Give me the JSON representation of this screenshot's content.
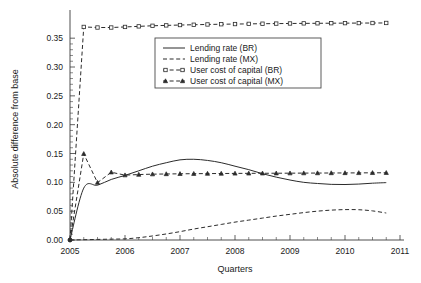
{
  "chart_data": {
    "type": "line",
    "title": "",
    "xlabel": "Quarters",
    "ylabel": "Absolute difference from base",
    "xlim": [
      2005.0,
      2011.0
    ],
    "ylim": [
      0.0,
      0.385
    ],
    "grid": false,
    "legend_position": "top-center",
    "xticks": [
      "2005",
      "2006",
      "2007",
      "2008",
      "2009",
      "2010",
      "2011"
    ],
    "xtick_values": [
      2005,
      2006,
      2007,
      2008,
      2009,
      2010,
      2011
    ],
    "yticks": [
      "0.00",
      "0.05",
      "0.10",
      "0.15",
      "0.20",
      "0.25",
      "0.30",
      "0.35"
    ],
    "ytick_values": [
      0.0,
      0.05,
      0.1,
      0.15,
      0.2,
      0.25,
      0.3,
      0.35
    ],
    "x": [
      2005.0,
      2005.25,
      2005.5,
      2005.75,
      2006.0,
      2006.25,
      2006.5,
      2006.75,
      2007.0,
      2007.25,
      2007.5,
      2007.75,
      2008.0,
      2008.25,
      2008.5,
      2008.75,
      2009.0,
      2009.25,
      2009.5,
      2009.75,
      2010.0,
      2010.25,
      2010.5,
      2010.75
    ],
    "series": [
      {
        "name": "Lending rate (BR)",
        "style": "solid",
        "marker": "none",
        "values": [
          0.0,
          0.09,
          0.095,
          0.105,
          0.112,
          0.12,
          0.128,
          0.134,
          0.139,
          0.14,
          0.138,
          0.134,
          0.128,
          0.122,
          0.115,
          0.109,
          0.104,
          0.1,
          0.098,
          0.0965,
          0.0962,
          0.097,
          0.0985,
          0.0995
        ]
      },
      {
        "name": "Lending rate (MX)",
        "style": "dashed",
        "marker": "none",
        "values": [
          0.0,
          0.0005,
          0.001,
          0.0015,
          0.002,
          0.004,
          0.007,
          0.0105,
          0.0145,
          0.019,
          0.023,
          0.027,
          0.031,
          0.0345,
          0.038,
          0.0415,
          0.0445,
          0.0475,
          0.05,
          0.0518,
          0.0527,
          0.0525,
          0.0505,
          0.0468
        ]
      },
      {
        "name": "User cost of capital (BR)",
        "style": "dashed",
        "marker": "square",
        "values": [
          0.0,
          0.3695,
          0.3685,
          0.3685,
          0.3695,
          0.3705,
          0.3715,
          0.3722,
          0.3728,
          0.3733,
          0.3738,
          0.3742,
          0.3745,
          0.3748,
          0.3751,
          0.3753,
          0.3755,
          0.3757,
          0.3758,
          0.376,
          0.3761,
          0.3762,
          0.3763,
          0.3764
        ]
      },
      {
        "name": "User cost of capital (MX)",
        "style": "dashed",
        "marker": "triangle",
        "values": [
          0.0,
          0.1495,
          0.0995,
          0.1175,
          0.1125,
          0.1135,
          0.1142,
          0.1145,
          0.1148,
          0.115,
          0.1152,
          0.1153,
          0.1155,
          0.1156,
          0.1157,
          0.1158,
          0.1159,
          0.116,
          0.1161,
          0.1162,
          0.1163,
          0.1164,
          0.1165,
          0.1166
        ]
      }
    ],
    "legend": [
      {
        "label": "Lending rate (BR)",
        "style": "solid",
        "marker": "none"
      },
      {
        "label": "Lending rate (MX)",
        "style": "dashed",
        "marker": "none"
      },
      {
        "label": "User cost of capital (BR)",
        "style": "dashed",
        "marker": "square"
      },
      {
        "label": "User cost of capital (MX)",
        "style": "dashed",
        "marker": "triangle"
      }
    ]
  },
  "colors": {
    "line": "#2b2b2b",
    "axis": "#3a3a3a",
    "background": "#ffffff"
  }
}
